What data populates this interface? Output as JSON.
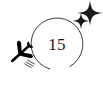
{
  "illustration": {
    "title": "flight-countdown-badge",
    "background_color": "#ffffff",
    "stroke_color": "#3a3a3a",
    "fill_color": "#000000",
    "text_color": "#1a1a1a"
  },
  "ring": {
    "name": "countdown-ring",
    "center_x": 57,
    "center_y": 44,
    "radius": 26,
    "stroke_width": 1,
    "gap_start_deg": 150,
    "gap_end_deg": 196
  },
  "counter": {
    "label": "15",
    "x": 57,
    "y": 50
  },
  "airplane": {
    "name": "airplane-icon",
    "glyph": "airplane",
    "x": 21,
    "y": 53,
    "rotation_deg": -42,
    "trail_dashes": 3
  },
  "sparkles": [
    {
      "name": "sparkle-large",
      "x": 90,
      "y": 13,
      "size": 6
    },
    {
      "name": "sparkle-small",
      "x": 81,
      "y": 21,
      "size": 4
    }
  ]
}
